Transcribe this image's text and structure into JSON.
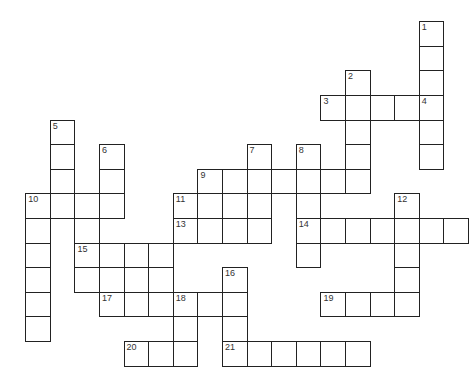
{
  "puzzle": {
    "type": "crossword",
    "origin": {
      "x": 26,
      "y": 22
    },
    "cell_size": 24.6,
    "cells": [
      {
        "r": 0,
        "c": 16,
        "n": "1"
      },
      {
        "r": 1,
        "c": 16
      },
      {
        "r": 2,
        "c": 13,
        "n": "2"
      },
      {
        "r": 2,
        "c": 16
      },
      {
        "r": 3,
        "c": 12,
        "n": "3"
      },
      {
        "r": 3,
        "c": 13
      },
      {
        "r": 3,
        "c": 14
      },
      {
        "r": 3,
        "c": 15
      },
      {
        "r": 3,
        "c": 16,
        "n": "4"
      },
      {
        "r": 4,
        "c": 1,
        "n": "5"
      },
      {
        "r": 4,
        "c": 13
      },
      {
        "r": 4,
        "c": 16
      },
      {
        "r": 5,
        "c": 1
      },
      {
        "r": 5,
        "c": 3,
        "n": "6"
      },
      {
        "r": 5,
        "c": 9,
        "n": "7"
      },
      {
        "r": 5,
        "c": 11,
        "n": "8"
      },
      {
        "r": 5,
        "c": 13
      },
      {
        "r": 5,
        "c": 16
      },
      {
        "r": 6,
        "c": 1
      },
      {
        "r": 6,
        "c": 3
      },
      {
        "r": 6,
        "c": 7,
        "n": "9"
      },
      {
        "r": 6,
        "c": 8
      },
      {
        "r": 6,
        "c": 9
      },
      {
        "r": 6,
        "c": 10
      },
      {
        "r": 6,
        "c": 11
      },
      {
        "r": 6,
        "c": 12
      },
      {
        "r": 6,
        "c": 13
      },
      {
        "r": 7,
        "c": 0,
        "n": "10"
      },
      {
        "r": 7,
        "c": 1
      },
      {
        "r": 7,
        "c": 2
      },
      {
        "r": 7,
        "c": 3
      },
      {
        "r": 7,
        "c": 6,
        "n": "11"
      },
      {
        "r": 7,
        "c": 7
      },
      {
        "r": 7,
        "c": 8
      },
      {
        "r": 7,
        "c": 9
      },
      {
        "r": 7,
        "c": 11
      },
      {
        "r": 7,
        "c": 15,
        "n": "12"
      },
      {
        "r": 8,
        "c": 0
      },
      {
        "r": 8,
        "c": 2
      },
      {
        "r": 8,
        "c": 6,
        "n": "13"
      },
      {
        "r": 8,
        "c": 7
      },
      {
        "r": 8,
        "c": 8
      },
      {
        "r": 8,
        "c": 9
      },
      {
        "r": 8,
        "c": 11,
        "n": "14"
      },
      {
        "r": 8,
        "c": 12
      },
      {
        "r": 8,
        "c": 13
      },
      {
        "r": 8,
        "c": 14
      },
      {
        "r": 8,
        "c": 15
      },
      {
        "r": 8,
        "c": 16
      },
      {
        "r": 8,
        "c": 17
      },
      {
        "r": 9,
        "c": 0
      },
      {
        "r": 9,
        "c": 2,
        "n": "15"
      },
      {
        "r": 9,
        "c": 3
      },
      {
        "r": 9,
        "c": 4
      },
      {
        "r": 9,
        "c": 5
      },
      {
        "r": 9,
        "c": 11
      },
      {
        "r": 9,
        "c": 15
      },
      {
        "r": 10,
        "c": 0
      },
      {
        "r": 10,
        "c": 2
      },
      {
        "r": 10,
        "c": 3
      },
      {
        "r": 10,
        "c": 4
      },
      {
        "r": 10,
        "c": 5
      },
      {
        "r": 10,
        "c": 8,
        "n": "16"
      },
      {
        "r": 10,
        "c": 15
      },
      {
        "r": 11,
        "c": 0
      },
      {
        "r": 11,
        "c": 3,
        "n": "17"
      },
      {
        "r": 11,
        "c": 4
      },
      {
        "r": 11,
        "c": 5
      },
      {
        "r": 11,
        "c": 6,
        "n": "18"
      },
      {
        "r": 11,
        "c": 7
      },
      {
        "r": 11,
        "c": 8
      },
      {
        "r": 11,
        "c": 12,
        "n": "19"
      },
      {
        "r": 11,
        "c": 13
      },
      {
        "r": 11,
        "c": 14
      },
      {
        "r": 11,
        "c": 15
      },
      {
        "r": 12,
        "c": 0
      },
      {
        "r": 12,
        "c": 6
      },
      {
        "r": 12,
        "c": 8
      },
      {
        "r": 13,
        "c": 4,
        "n": "20"
      },
      {
        "r": 13,
        "c": 5
      },
      {
        "r": 13,
        "c": 6
      },
      {
        "r": 13,
        "c": 8,
        "n": "21"
      },
      {
        "r": 13,
        "c": 9
      },
      {
        "r": 13,
        "c": 10
      },
      {
        "r": 13,
        "c": 11
      },
      {
        "r": 13,
        "c": 12
      },
      {
        "r": 13,
        "c": 13
      }
    ]
  }
}
